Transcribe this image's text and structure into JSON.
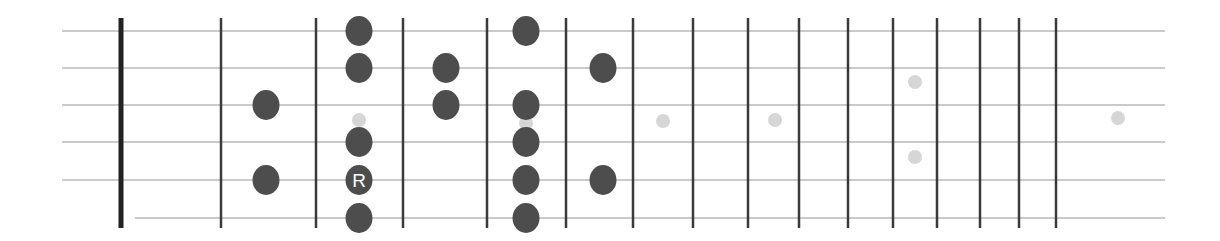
{
  "diagram": {
    "type": "guitar-fretboard-scale-pattern",
    "colors": {
      "background": "#ffffff",
      "string": "#b8b8b8",
      "fret": "#3a3a3a",
      "nut": "#222222",
      "note": "#4d4d4d",
      "root_text": "#ffffff",
      "inlay": "#d6d6d6"
    },
    "strings_y": [
      31,
      68,
      105,
      142,
      180,
      218
    ],
    "string_x_start": 62,
    "string_x_end": 1165,
    "nut_x": 121,
    "frets_x": [
      221,
      316,
      403,
      487,
      566,
      633,
      693,
      748,
      799,
      848,
      893,
      937,
      980,
      1019,
      1056
    ],
    "fret_top": 18,
    "fret_bottom": 228,
    "notes": [
      {
        "fret": 1,
        "string": 3,
        "x": 266,
        "label": ""
      },
      {
        "fret": 1,
        "string": 5,
        "x": 266,
        "label": ""
      },
      {
        "fret": 2,
        "string": 1,
        "x": 359,
        "label": ""
      },
      {
        "fret": 2,
        "string": 2,
        "x": 359,
        "label": ""
      },
      {
        "fret": 2,
        "string": 4,
        "x": 359,
        "label": ""
      },
      {
        "fret": 2,
        "string": 5,
        "x": 359,
        "label": "R"
      },
      {
        "fret": 2,
        "string": 6,
        "x": 359,
        "label": ""
      },
      {
        "fret": 3,
        "string": 2,
        "x": 446,
        "label": ""
      },
      {
        "fret": 3,
        "string": 3,
        "x": 446,
        "label": ""
      },
      {
        "fret": 4,
        "string": 1,
        "x": 526,
        "label": ""
      },
      {
        "fret": 4,
        "string": 3,
        "x": 526,
        "label": ""
      },
      {
        "fret": 4,
        "string": 4,
        "x": 526,
        "label": ""
      },
      {
        "fret": 4,
        "string": 5,
        "x": 526,
        "label": ""
      },
      {
        "fret": 4,
        "string": 6,
        "x": 526,
        "label": ""
      },
      {
        "fret": 5,
        "string": 2,
        "x": 603,
        "label": ""
      },
      {
        "fret": 5,
        "string": 5,
        "x": 603,
        "label": ""
      }
    ],
    "inlays": [
      {
        "x": 359,
        "y": 120
      },
      {
        "x": 526,
        "y": 123
      },
      {
        "x": 663,
        "y": 121
      },
      {
        "x": 775,
        "y": 120
      },
      {
        "x": 915,
        "y": 82
      },
      {
        "x": 915,
        "y": 157
      },
      {
        "x": 1118,
        "y": 118
      }
    ],
    "root_label": "R"
  }
}
